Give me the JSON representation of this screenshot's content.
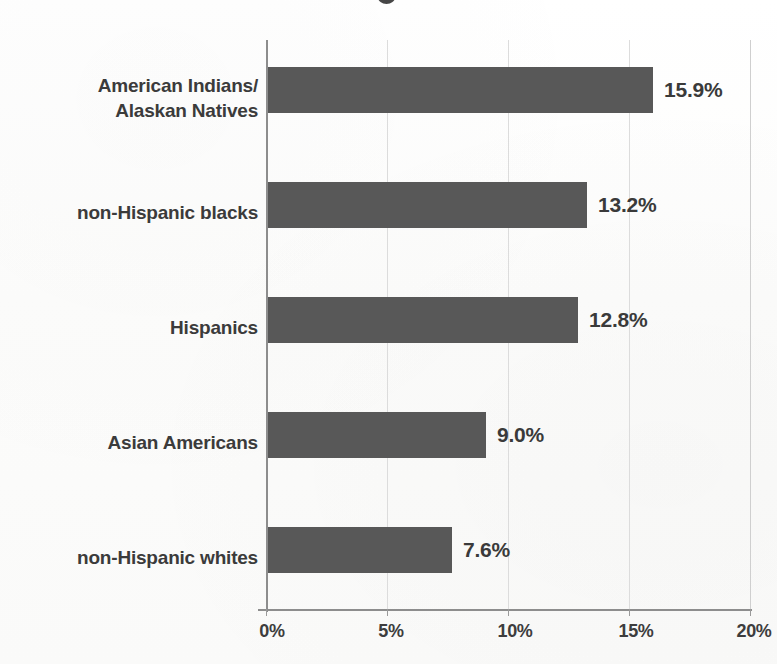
{
  "chart_data": {
    "type": "bar",
    "orientation": "horizontal",
    "title": "",
    "xlabel": "",
    "ylabel": "",
    "categories": [
      "American Indians/\nAlaskan Natives",
      "non-Hispanic blacks",
      "Hispanics",
      "Asian Americans",
      "non-Hispanic whites"
    ],
    "values": [
      15.9,
      13.2,
      12.8,
      9.0,
      7.6
    ],
    "value_labels": [
      "15.9%",
      "13.2%",
      "12.8%",
      "9.0%",
      "7.6%"
    ],
    "xlim": [
      0,
      20
    ],
    "xticks": [
      0,
      5,
      10,
      15,
      20
    ],
    "xtick_labels": [
      "0%",
      "5%",
      "10%",
      "15%",
      "20%"
    ],
    "grid": true,
    "legend": false,
    "bar_color": "#585858",
    "text_color": "#3b3b3b",
    "gridline_color": "#dcdcdc",
    "axis_color": "#8d8d8d",
    "background_color": "#fdfdfd"
  },
  "categories_display": [
    {
      "line1": "American Indians/",
      "line2": "Alaskan Natives"
    },
    {
      "line1": "non-Hispanic blacks",
      "line2": ""
    },
    {
      "line1": "Hispanics",
      "line2": ""
    },
    {
      "line1": "Asian Americans",
      "line2": ""
    },
    {
      "line1": "non-Hispanic whites",
      "line2": ""
    }
  ]
}
